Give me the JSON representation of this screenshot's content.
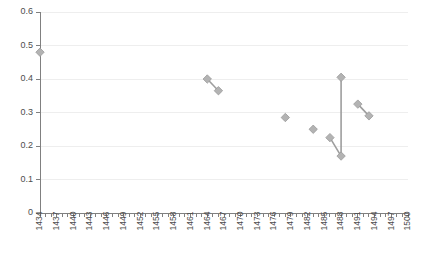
{
  "chart_data": {
    "type": "scatter",
    "title": "",
    "subtitle": "",
    "xlabel": "",
    "ylabel": "",
    "xlim": [
      1434,
      1500
    ],
    "ylim": [
      0,
      0.6
    ],
    "grid": true,
    "legend": null,
    "marker_style": "diamond",
    "marker_color": "#b3b3b3",
    "line_color": "#9e9e9e",
    "y_ticks": [
      0,
      0.1,
      0.2,
      0.3,
      0.4,
      0.5,
      0.6
    ],
    "y_tick_labels": [
      "0",
      "0.1",
      "0.2",
      "0.3",
      "0.4",
      "0.5",
      "0.6"
    ],
    "x_tick_labels": [
      "1434",
      "1437",
      "1440",
      "1443",
      "1446",
      "1449",
      "1452",
      "1455",
      "1458",
      "1461",
      "1464",
      "1467",
      "1470",
      "1473",
      "1476",
      "1479",
      "1482",
      "1485",
      "1488",
      "1491",
      "1494",
      "1497",
      "1500"
    ],
    "x_tick_label_step": 3,
    "x_minor_tick_step": 1,
    "points": [
      {
        "x": 1434,
        "y": 0.48
      },
      {
        "x": 1464,
        "y": 0.4
      },
      {
        "x": 1466,
        "y": 0.365
      },
      {
        "x": 1478,
        "y": 0.285
      },
      {
        "x": 1483,
        "y": 0.25
      },
      {
        "x": 1486,
        "y": 0.225
      },
      {
        "x": 1488,
        "y": 0.17
      },
      {
        "x": 1488,
        "y": 0.405
      },
      {
        "x": 1491,
        "y": 0.325
      },
      {
        "x": 1493,
        "y": 0.29
      }
    ],
    "segments": [
      [
        {
          "x": 1464,
          "y": 0.4
        },
        {
          "x": 1466,
          "y": 0.365
        }
      ],
      [
        {
          "x": 1486,
          "y": 0.225
        },
        {
          "x": 1488,
          "y": 0.17
        },
        {
          "x": 1488,
          "y": 0.405
        }
      ],
      [
        {
          "x": 1491,
          "y": 0.325
        },
        {
          "x": 1493,
          "y": 0.29
        }
      ]
    ]
  }
}
